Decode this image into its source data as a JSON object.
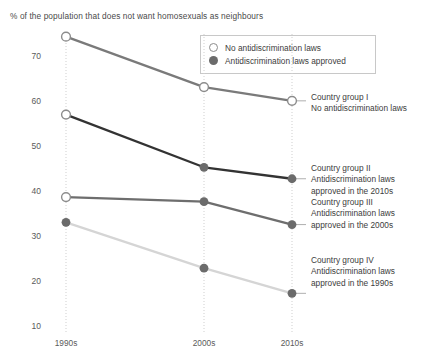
{
  "chart_data": {
    "type": "line",
    "title": "% of the population that does not want homosexuals as neighbours",
    "xlabel": "",
    "ylabel": "",
    "categories": [
      "1990s",
      "2000s",
      "2010s"
    ],
    "ylim": [
      5,
      78
    ],
    "yticks": [
      70,
      60,
      50,
      40,
      30,
      20,
      10
    ],
    "grid": "vertical dotted gridlines at each category",
    "legend_position": "top-center-right inside plot, bordered box",
    "series": [
      {
        "name": "Country group I",
        "values": [
          74,
          63,
          60
        ],
        "marker": "open",
        "color": "#7a7a7a"
      },
      {
        "name": "Country group II",
        "values": [
          57,
          45.5,
          43
        ],
        "marker": "open-then-filled",
        "color": "#333333"
      },
      {
        "name": "Country group III",
        "values": [
          39,
          38,
          33
        ],
        "marker": "open-then-filled",
        "color": "#6e6e6e"
      },
      {
        "name": "Country group IV",
        "values": [
          33.5,
          23.5,
          18
        ],
        "marker": "filled",
        "color": "#d5d5d5"
      }
    ]
  },
  "legend": {
    "items": [
      {
        "label": "No antidiscrimination laws",
        "marker": "open"
      },
      {
        "label": "Antidiscrimination laws approved",
        "marker": "filled"
      }
    ]
  },
  "annotations": [
    {
      "line1": "Country group I",
      "line2": "No antidiscrimination laws",
      "line3": ""
    },
    {
      "line1": "Country group II",
      "line2": "Antidiscrimination laws",
      "line3": "approved in the 2010s"
    },
    {
      "line1": "Country group III",
      "line2": "Antidiscrimination laws",
      "line3": "approved in the 2000s"
    },
    {
      "line1": "Country group IV",
      "line2": "Antidiscrimination laws",
      "line3": "approved in the 1990s"
    }
  ],
  "axis": {
    "yticks": [
      "70",
      "60",
      "50",
      "40",
      "30",
      "20",
      "10"
    ],
    "xticks": [
      "1990s",
      "2000s",
      "2010s"
    ]
  },
  "colors": {
    "group1": "#7a7a7a",
    "group2": "#333333",
    "group3": "#6e6e6e",
    "group4": "#d5d5d5",
    "grid": "#cfcfcf",
    "text": "#3c3c3c"
  }
}
